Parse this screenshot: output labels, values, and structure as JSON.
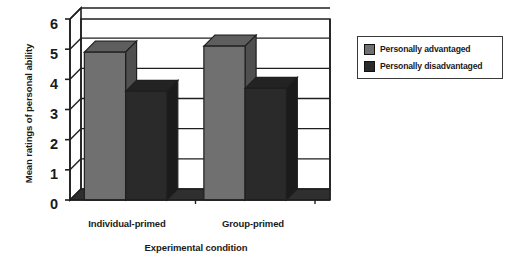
{
  "chart_data": {
    "type": "bar",
    "title": "",
    "xlabel": "Experimental condition",
    "ylabel": "Mean ratings of personal ability",
    "categories": [
      "Individual-primed",
      "Group-primed"
    ],
    "series": [
      {
        "name": "Personally advantaged",
        "values": [
          4.9,
          5.1
        ],
        "color": "#707070"
      },
      {
        "name": "Personally disadvantaged",
        "values": [
          3.6,
          3.7
        ],
        "color": "#2a2a2a"
      }
    ],
    "ylim": [
      0,
      6
    ],
    "yticks": [
      6,
      5,
      4,
      3,
      2,
      1,
      0
    ],
    "grid": true,
    "legend_position": "right",
    "style": "3d-column"
  },
  "legend": {
    "entries": [
      {
        "label": "Personally advantaged",
        "swatch": "#707070"
      },
      {
        "label": "Personally disadvantaged",
        "swatch": "#2a2a2a"
      }
    ]
  },
  "axes": {
    "y_title": "Mean ratings of personal ability",
    "x_title": "Experimental condition",
    "y_tick_labels": [
      "6",
      "5",
      "4",
      "3",
      "2",
      "1",
      "0"
    ],
    "x_tick_labels": [
      "Individual-primed",
      "Group-primed"
    ]
  },
  "colors": {
    "advantaged": "#707070",
    "disadvantaged": "#2a2a2a",
    "frame": "#1f1f1f",
    "background": "#ffffff"
  }
}
